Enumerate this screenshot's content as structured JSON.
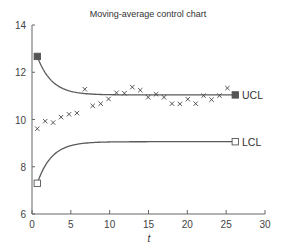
{
  "chart_data": {
    "type": "line",
    "title": "Moving-average control chart",
    "xlabel": "t",
    "ylabel": "",
    "xlim": [
      0,
      30
    ],
    "ylim": [
      6,
      14
    ],
    "x_ticks": [
      0,
      5,
      10,
      15,
      20,
      25,
      30
    ],
    "y_ticks": [
      6,
      8,
      10,
      12,
      14
    ],
    "grid": false,
    "legend": null,
    "series": [
      {
        "name": "Moving average",
        "marker": "x",
        "x": [
          1,
          2,
          3,
          4,
          5,
          6,
          7,
          8,
          9,
          10,
          11,
          12,
          13,
          14,
          15,
          16,
          17,
          18,
          19,
          20,
          21,
          22,
          23,
          24,
          25
        ],
        "values": [
          9.61,
          9.93,
          9.87,
          10.1,
          10.22,
          10.27,
          11.28,
          10.58,
          10.67,
          10.87,
          11.13,
          11.11,
          11.37,
          11.24,
          10.94,
          11.07,
          10.94,
          10.67,
          10.66,
          10.86,
          10.67,
          11.01,
          10.84,
          11.01,
          11.33
        ]
      },
      {
        "name": "UCL",
        "marker": "filled-square-endpoints",
        "start": {
          "t": 1,
          "value": 12.67
        },
        "steady_value": 11.04,
        "end": {
          "t": 26,
          "value": 11.04
        }
      },
      {
        "name": "LCL",
        "marker": "open-square-endpoints",
        "start": {
          "t": 1,
          "value": 7.3
        },
        "steady_value": 9.06,
        "end": {
          "t": 26,
          "value": 9.06
        }
      }
    ],
    "annotations": [
      "UCL",
      "LCL"
    ]
  },
  "labels": {
    "title": "Moving-average control chart",
    "xlabel": "t",
    "ucl": "UCL",
    "lcl": "LCL"
  },
  "colors": {
    "line": "#5a5a5a",
    "points": "#444444",
    "ucl_marker": "#555555"
  }
}
